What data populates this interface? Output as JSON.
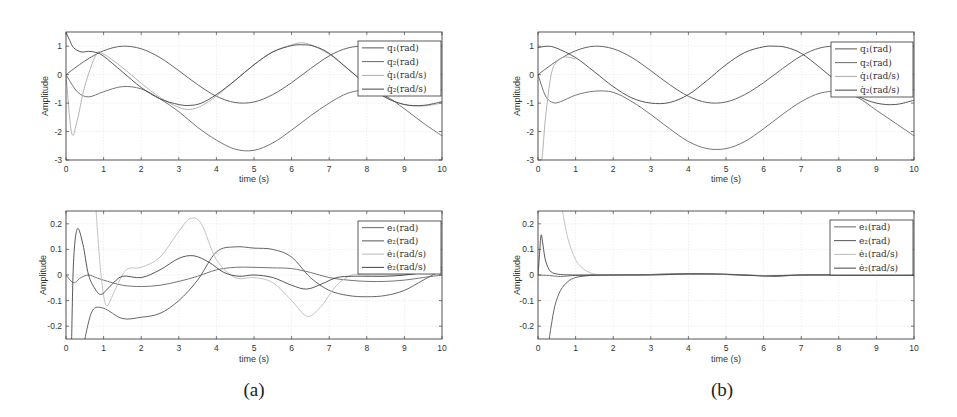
{
  "figure": {
    "captions": [
      "(a)",
      "(b)"
    ]
  },
  "chart_data": [
    {
      "id": "a_top",
      "panel": "(a)",
      "type": "line",
      "title": "",
      "xlabel": "time (s)",
      "ylabel": "Amplitude",
      "xlim": [
        0,
        10
      ],
      "ylim": [
        -3,
        1.5
      ],
      "xticks": [
        0,
        1,
        2,
        3,
        4,
        5,
        6,
        7,
        8,
        9,
        10
      ],
      "yticks": [
        -3,
        -2,
        -1,
        0,
        1
      ],
      "grid": true,
      "legend_position": "upper right",
      "series": [
        {
          "name": "q1(rad)",
          "label_html": "q₁(rad)",
          "color": "#555555",
          "x": [
            0,
            0.5,
            1,
            1.5,
            2,
            2.5,
            3,
            3.5,
            4,
            4.5,
            5,
            5.5,
            6,
            6.5,
            7,
            7.5,
            8,
            8.5,
            9,
            9.5,
            10
          ],
          "y": [
            0,
            0.48,
            0.84,
            1.0,
            0.91,
            0.6,
            0.14,
            -0.35,
            -0.76,
            -0.98,
            -0.96,
            -0.7,
            -0.28,
            0.21,
            0.66,
            0.94,
            0.99,
            0.8,
            0.41,
            -0.08,
            -0.54
          ]
        },
        {
          "name": "q2(rad)",
          "label_html": "q₂(rad)",
          "color": "#666666",
          "x": [
            0,
            0.3,
            0.6,
            1,
            1.5,
            2,
            2.5,
            3,
            3.5,
            4,
            4.5,
            5,
            5.5,
            6,
            6.5,
            7,
            7.5,
            8,
            8.5,
            9,
            9.5,
            10
          ],
          "y": [
            0,
            -0.6,
            -0.78,
            -0.6,
            -0.42,
            -0.5,
            -0.85,
            -1.3,
            -1.85,
            -2.3,
            -2.62,
            -2.66,
            -2.4,
            -1.95,
            -1.45,
            -1.0,
            -0.65,
            -0.55,
            -0.75,
            -1.2,
            -1.7,
            -2.15
          ]
        },
        {
          "name": "q̇1(rad/s)",
          "label_html": "q̇₁(rad/s)",
          "color": "#aaaaaa",
          "x": [
            0,
            0.15,
            0.3,
            0.5,
            0.8,
            1,
            1.5,
            2,
            2.5,
            3,
            3.3,
            3.6,
            4,
            4.5,
            5,
            5.5,
            6,
            6.3,
            6.6,
            7,
            7.5,
            8,
            8.5,
            9,
            9.5,
            10
          ],
          "y": [
            0,
            -2.05,
            -1.6,
            -0.4,
            0.7,
            0.72,
            0.25,
            -0.3,
            -0.8,
            -1.15,
            -1.22,
            -1.1,
            -0.75,
            -0.2,
            0.35,
            0.8,
            1.05,
            1.12,
            1.0,
            0.72,
            0.2,
            -0.35,
            -0.8,
            -1.05,
            -1.1,
            -1.0
          ]
        },
        {
          "name": "q̇2(rad/s)",
          "label_html": "q̇₂(rad/s)",
          "color": "#444444",
          "x": [
            0,
            0.1,
            0.2,
            0.4,
            0.6,
            0.8,
            1,
            1.5,
            2,
            2.5,
            3,
            3.3,
            3.6,
            4,
            4.5,
            5,
            5.5,
            6,
            6.3,
            6.6,
            7,
            7.5,
            8,
            8.5,
            9,
            9.5,
            10
          ],
          "y": [
            1.5,
            1.2,
            0.95,
            0.8,
            0.82,
            0.78,
            0.65,
            0.1,
            -0.45,
            -0.85,
            -1.05,
            -1.08,
            -1.0,
            -0.7,
            -0.2,
            0.35,
            0.8,
            1.02,
            1.05,
            1.0,
            0.75,
            0.2,
            -0.35,
            -0.8,
            -1.05,
            -1.08,
            -0.95
          ]
        }
      ]
    },
    {
      "id": "a_bottom",
      "panel": "(a)",
      "type": "line",
      "title": "",
      "xlabel": "time (s)",
      "ylabel": "Amplitude",
      "xlim": [
        0,
        10
      ],
      "ylim": [
        -0.25,
        0.25
      ],
      "xticks": [
        0,
        1,
        2,
        3,
        4,
        5,
        6,
        7,
        8,
        9,
        10
      ],
      "yticks": [
        -0.2,
        -0.1,
        0,
        0.1,
        0.2
      ],
      "grid": true,
      "legend_position": "upper right",
      "series": [
        {
          "name": "e1(rad)",
          "label_html": "e₁(rad)",
          "color": "#666666",
          "x": [
            0,
            0.2,
            0.4,
            0.6,
            0.8,
            1,
            1.5,
            2,
            2.5,
            3,
            3.5,
            4,
            4.5,
            5,
            5.5,
            6,
            6.5,
            7,
            7.5,
            8,
            8.5,
            9,
            9.5,
            10
          ],
          "y": [
            0,
            -0.03,
            -0.01,
            0.0,
            -0.01,
            -0.02,
            -0.04,
            -0.045,
            -0.04,
            -0.025,
            -0.005,
            0.02,
            0.03,
            0.03,
            0.028,
            0.025,
            0.01,
            -0.01,
            -0.02,
            -0.025,
            -0.025,
            -0.02,
            -0.01,
            0.0
          ]
        },
        {
          "name": "e2(rad)",
          "label_html": "e₂(rad)",
          "color": "#555555",
          "x": [
            0.5,
            0.7,
            1,
            1.5,
            2,
            2.5,
            3,
            3.5,
            4,
            4.5,
            5,
            5.5,
            6,
            6.5,
            7,
            7.5,
            8,
            8.5,
            9,
            9.5,
            10
          ],
          "y": [
            -0.25,
            -0.14,
            -0.13,
            -0.17,
            -0.165,
            -0.15,
            -0.1,
            -0.02,
            0.09,
            0.11,
            0.105,
            0.1,
            0.07,
            -0.01,
            -0.06,
            -0.08,
            -0.085,
            -0.08,
            -0.06,
            -0.02,
            0.02
          ]
        },
        {
          "name": "ė1(rad/s)",
          "label_html": "ė₁(rad/s)",
          "color": "#bbbbbb",
          "x": [
            0.8,
            0.9,
            1.0,
            1.1,
            1.3,
            1.6,
            2,
            2.5,
            3,
            3.3,
            3.6,
            4,
            4.5,
            5,
            5.5,
            6,
            6.3,
            6.5,
            6.8,
            7.2,
            7.6,
            8,
            8.5,
            9,
            9.5,
            10
          ],
          "y": [
            0.25,
            0.05,
            -0.08,
            -0.12,
            -0.06,
            0.02,
            0.03,
            0.07,
            0.17,
            0.22,
            0.2,
            0.06,
            -0.01,
            -0.01,
            -0.03,
            -0.1,
            -0.15,
            -0.16,
            -0.12,
            -0.04,
            0.0,
            0.0,
            0.0,
            0.0,
            0.01,
            0.01
          ]
        },
        {
          "name": "ė2(rad/s)",
          "label_html": "ė₂(rad/s)",
          "color": "#444444",
          "x": [
            0.15,
            0.2,
            0.3,
            0.45,
            0.6,
            0.8,
            0.95,
            1.2,
            1.5,
            2,
            2.5,
            3,
            3.4,
            3.8,
            4.2,
            4.6,
            5,
            5.5,
            6,
            6.4,
            6.8,
            7.2,
            7.6,
            8,
            8.5,
            9,
            9.5,
            10
          ],
          "y": [
            -0.25,
            0.05,
            0.18,
            0.12,
            0.0,
            -0.06,
            -0.075,
            -0.04,
            -0.005,
            -0.01,
            0.02,
            0.065,
            0.075,
            0.05,
            0.01,
            -0.005,
            0.0,
            -0.01,
            -0.04,
            -0.055,
            -0.035,
            -0.01,
            -0.005,
            -0.005,
            -0.005,
            0.0,
            0.01,
            0.03
          ]
        }
      ]
    },
    {
      "id": "b_top",
      "panel": "(b)",
      "type": "line",
      "title": "",
      "xlabel": "time (s)",
      "ylabel": "Amplitude",
      "xlim": [
        0,
        10
      ],
      "ylim": [
        -3,
        1.5
      ],
      "xticks": [
        0,
        1,
        2,
        3,
        4,
        5,
        6,
        7,
        8,
        9,
        10
      ],
      "yticks": [
        -3,
        -2,
        -1,
        0,
        1
      ],
      "grid": true,
      "legend_position": "upper right",
      "series": [
        {
          "name": "q1(rad)",
          "label_html": "q₁(rad)",
          "color": "#555555",
          "x": [
            0,
            0.5,
            1,
            1.5,
            2,
            2.5,
            3,
            3.5,
            4,
            4.5,
            5,
            5.5,
            6,
            6.5,
            7,
            7.5,
            8,
            8.5,
            9,
            9.5,
            10
          ],
          "y": [
            0,
            0.48,
            0.84,
            1.0,
            0.91,
            0.6,
            0.14,
            -0.35,
            -0.76,
            -0.98,
            -0.96,
            -0.7,
            -0.28,
            0.21,
            0.66,
            0.94,
            0.99,
            0.8,
            0.41,
            -0.08,
            -0.54
          ]
        },
        {
          "name": "q2(rad)",
          "label_html": "q₂(rad)",
          "color": "#666666",
          "x": [
            0,
            0.2,
            0.4,
            0.6,
            1,
            1.5,
            2,
            2.5,
            3,
            3.5,
            4,
            4.5,
            5,
            5.5,
            6,
            6.5,
            7,
            7.5,
            8,
            8.5,
            9,
            9.5,
            10
          ],
          "y": [
            0,
            -0.75,
            -0.98,
            -0.95,
            -0.72,
            -0.58,
            -0.62,
            -0.95,
            -1.4,
            -1.9,
            -2.35,
            -2.6,
            -2.6,
            -2.35,
            -1.9,
            -1.4,
            -0.95,
            -0.65,
            -0.6,
            -0.8,
            -1.25,
            -1.7,
            -2.15
          ]
        },
        {
          "name": "q̇1(rad/s)",
          "label_html": "q̇₁(rad/s)",
          "color": "#aaaaaa",
          "x": [
            0,
            0.1,
            0.2,
            0.35,
            0.5,
            0.7,
            1
          ],
          "y": [
            -3,
            -3,
            -1.5,
            0.0,
            0.45,
            0.62,
            0.56
          ]
        },
        {
          "name": "q̇2(rad/s)",
          "label_html": "q̇₂(rad/s)",
          "color": "#444444",
          "x": [
            0,
            0.25,
            0.5,
            1,
            1.5,
            2,
            2.5,
            3,
            3.5,
            4,
            4.5,
            5,
            5.5,
            6,
            6.3,
            6.6,
            7,
            7.5,
            8,
            8.5,
            9,
            9.5,
            10
          ],
          "y": [
            0.95,
            1.0,
            0.93,
            0.6,
            0.1,
            -0.42,
            -0.82,
            -1.0,
            -0.98,
            -0.7,
            -0.2,
            0.35,
            0.78,
            0.98,
            1.0,
            0.96,
            0.75,
            0.25,
            -0.3,
            -0.75,
            -1.0,
            -1.05,
            -0.9
          ]
        }
      ]
    },
    {
      "id": "b_bottom",
      "panel": "(b)",
      "type": "line",
      "title": "",
      "xlabel": "time (s)",
      "ylabel": "Amplitude",
      "xlim": [
        0,
        10
      ],
      "ylim": [
        -0.25,
        0.25
      ],
      "xticks": [
        0,
        1,
        2,
        3,
        4,
        5,
        6,
        7,
        8,
        9,
        10
      ],
      "yticks": [
        -0.2,
        -0.1,
        0,
        0.1,
        0.2
      ],
      "grid": true,
      "legend_position": "upper right",
      "series": [
        {
          "name": "e1(rad)",
          "label_html": "e₁(rad)",
          "color": "#666666",
          "x": [
            0,
            0.3,
            0.6,
            1,
            2,
            3,
            4,
            5,
            6,
            6.3,
            7,
            8,
            9,
            10
          ],
          "y": [
            0,
            -0.002,
            -0.006,
            -0.002,
            0,
            0.002,
            0.005,
            0.003,
            -0.003,
            -0.006,
            0,
            0,
            0,
            0
          ]
        },
        {
          "name": "e2(rad)",
          "label_html": "e₂(rad)",
          "color": "#555555",
          "x": [
            0.3,
            0.35,
            0.45,
            0.6,
            0.8,
            1.0,
            1.3,
            1.6,
            2,
            3,
            4,
            5,
            6,
            7,
            8,
            9,
            10
          ],
          "y": [
            -0.25,
            -0.2,
            -0.12,
            -0.06,
            -0.025,
            -0.01,
            -0.003,
            0,
            0,
            0.002,
            0.004,
            0.002,
            -0.003,
            0,
            0,
            0,
            0
          ]
        },
        {
          "name": "ė1(rad/s)",
          "label_html": "ė₁(rad/s)",
          "color": "#bbbbbb",
          "x": [
            0.65,
            0.8,
            1.0,
            1.2,
            1.4,
            1.6,
            2,
            3,
            4,
            5,
            6,
            7,
            8,
            9,
            10
          ],
          "y": [
            0.25,
            0.14,
            0.06,
            0.025,
            0.008,
            0.002,
            0,
            0,
            0.003,
            0.002,
            -0.002,
            0,
            0,
            0,
            0
          ]
        },
        {
          "name": "ė2(rad/s)",
          "label_html": "ė₂(rad/s)",
          "color": "#444444",
          "x": [
            0,
            0.04,
            0.08,
            0.12,
            0.18,
            0.25,
            0.35,
            0.5,
            0.7,
            1.0,
            1.5,
            2,
            3,
            4,
            5,
            6,
            7,
            8,
            9,
            10
          ],
          "y": [
            0,
            0.08,
            0.155,
            0.13,
            0.07,
            0.035,
            0.012,
            0.004,
            0.001,
            0,
            0,
            0,
            0,
            0.004,
            0.003,
            -0.004,
            0,
            0,
            0,
            0
          ]
        }
      ]
    }
  ]
}
